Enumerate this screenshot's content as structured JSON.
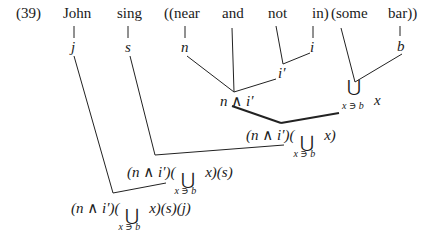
{
  "diagram": {
    "label": "(39)",
    "words": [
      "John",
      "sing",
      "((near",
      "and",
      "not",
      "in)",
      "(some",
      "bar))"
    ],
    "leaf_symbols": {
      "john": "j",
      "sing": "s",
      "near": "n",
      "in": "i",
      "bar": "b"
    },
    "intermediate": {
      "not_in": "i′",
      "near_and_not_in": "n ∧ i′",
      "some_bar_union": "⋃",
      "some_bar_sub": "x ∋ b",
      "some_bar_var": "x"
    },
    "nodes": {
      "level1_prefix": "(n ∧ i′)(",
      "level1_union": "⋃",
      "level1_sub": "x ∋ b",
      "level1_suffix": "x)",
      "level2_prefix": "(n ∧ i′)(",
      "level2_union": "⋃",
      "level2_sub": "x ∋ b",
      "level2_suffix": "x)(s)",
      "level3_prefix": "(n ∧ i′)(",
      "level3_union": "⋃",
      "level3_sub": "x ∋ b",
      "level3_suffix": "x)(s)(j)"
    }
  }
}
